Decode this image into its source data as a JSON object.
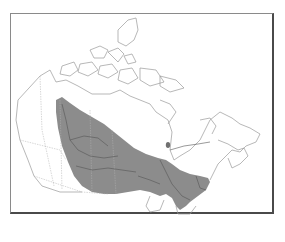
{
  "map": {
    "region": "Canada",
    "type": "range-map",
    "colors": {
      "background": "#ffffff",
      "frame": "#4a4a4a",
      "outline": "#9a9a9a",
      "range_fill": "#8c8c8c",
      "rivers": "#555555"
    },
    "legend": [],
    "labels": []
  }
}
